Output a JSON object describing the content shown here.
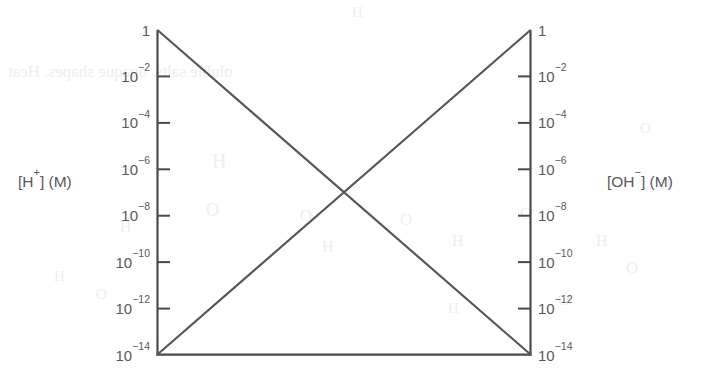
{
  "chart_data": {
    "type": "line",
    "title": "",
    "subtitle": "",
    "xlabel": "",
    "ylabel": "[H+] (M)",
    "y2label": "[OH-] (M)",
    "scale": "log",
    "grid": false,
    "legend": "none",
    "ylim": [
      1e-14,
      1
    ],
    "y2lim": [
      1e-14,
      1
    ],
    "yticks": [
      1,
      0.01,
      0.0001,
      1e-06,
      1e-08,
      1e-10,
      1e-12,
      1e-14
    ],
    "ytick_labels": [
      {
        "mantissa": "1",
        "exponent": ""
      },
      {
        "mantissa": "10",
        "exponent": "−2"
      },
      {
        "mantissa": "10",
        "exponent": "−4"
      },
      {
        "mantissa": "10",
        "exponent": "−6"
      },
      {
        "mantissa": "10",
        "exponent": "−8"
      },
      {
        "mantissa": "10",
        "exponent": "−10"
      },
      {
        "mantissa": "10",
        "exponent": "−12"
      },
      {
        "mantissa": "10",
        "exponent": "−14"
      }
    ],
    "xticks": [],
    "xtick_labels": [],
    "series": [
      {
        "name": "[H+] (M)",
        "axis": "left",
        "color": "#58585a",
        "x": [
          0,
          1
        ],
        "values": [
          1,
          1e-14
        ],
        "description": "decreasing diagonal from 1 at left to 10^-14 at right"
      },
      {
        "name": "[OH-] (M)",
        "axis": "right",
        "color": "#58585a",
        "x": [
          0,
          1
        ],
        "values": [
          1e-14,
          1
        ],
        "description": "increasing diagonal from 10^-14 at left to 1 at right"
      }
    ],
    "intersection": {
      "x": 0.5,
      "y": 1e-07,
      "label": ""
    },
    "annotations": []
  },
  "axes": {
    "left": {
      "title_bracket_open": "[",
      "title_species": "H",
      "title_charge": "+",
      "title_bracket_close": "] (M)",
      "title_full": "[H+] (M)"
    },
    "right": {
      "title_bracket_open": "[",
      "title_species": "OH",
      "title_charge": "−",
      "title_bracket_close": "] (M)",
      "title_full": "[OH−] (M)"
    }
  },
  "style": {
    "line_color": "#58585a",
    "axis_color": "#4a4a4c",
    "text_color": "#59595b",
    "background": "#ffffff",
    "bleed_color": "#f0eeec"
  },
  "scan_bleed": [
    {
      "text": "H",
      "x": 352,
      "y": 4,
      "size": 15
    },
    {
      "text": "oluble salts, opaque shapes. Heat",
      "x": 8,
      "y": 62,
      "size": 17
    },
    {
      "text": "H",
      "x": 212,
      "y": 150,
      "size": 20
    },
    {
      "text": "O",
      "x": 206,
      "y": 200,
      "size": 18
    },
    {
      "text": "H",
      "x": 120,
      "y": 218,
      "size": 16
    },
    {
      "text": "O",
      "x": 300,
      "y": 206,
      "size": 17
    },
    {
      "text": "H",
      "x": 322,
      "y": 238,
      "size": 16
    },
    {
      "text": "O",
      "x": 400,
      "y": 210,
      "size": 17
    },
    {
      "text": "H",
      "x": 452,
      "y": 232,
      "size": 16
    },
    {
      "text": "O",
      "x": 520,
      "y": 204,
      "size": 17
    },
    {
      "text": "H",
      "x": 596,
      "y": 232,
      "size": 16
    },
    {
      "text": "O",
      "x": 626,
      "y": 258,
      "size": 17
    },
    {
      "text": "H",
      "x": 54,
      "y": 268,
      "size": 15
    },
    {
      "text": "O",
      "x": 96,
      "y": 286,
      "size": 15
    },
    {
      "text": "H",
      "x": 448,
      "y": 300,
      "size": 15
    },
    {
      "text": "O",
      "x": 558,
      "y": 292,
      "size": 15
    },
    {
      "text": "H",
      "x": 660,
      "y": 176,
      "size": 15
    },
    {
      "text": "O",
      "x": 640,
      "y": 120,
      "size": 15
    }
  ]
}
